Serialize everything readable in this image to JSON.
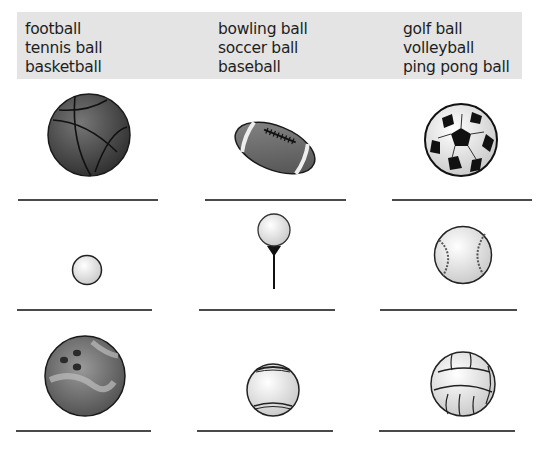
{
  "word_bank": {
    "columns": [
      [
        "football",
        "tennis ball",
        "basketball"
      ],
      [
        "bowling ball",
        "soccer ball",
        "baseball"
      ],
      [
        "golf ball",
        "volleyball",
        "ping pong ball"
      ]
    ]
  },
  "exercise": {
    "rows": [
      [
        {
          "picture": "basketball",
          "answer": ""
        },
        {
          "picture": "football",
          "answer": ""
        },
        {
          "picture": "soccer ball",
          "answer": ""
        }
      ],
      [
        {
          "picture": "ping pong ball",
          "answer": ""
        },
        {
          "picture": "golf ball on tee",
          "answer": ""
        },
        {
          "picture": "baseball",
          "answer": ""
        }
      ],
      [
        {
          "picture": "bowling ball",
          "answer": ""
        },
        {
          "picture": "tennis ball",
          "answer": ""
        },
        {
          "picture": "volleyball",
          "answer": ""
        }
      ]
    ]
  },
  "colors": {
    "word_bank_bg": "#e4e4e4",
    "line": "#4a4a4a"
  }
}
